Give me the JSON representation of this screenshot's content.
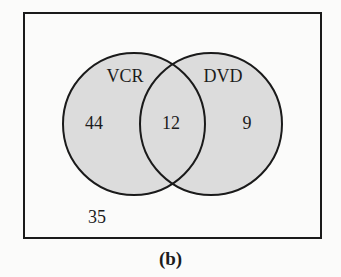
{
  "diagram": {
    "type": "venn",
    "universe_count": "35",
    "sets": [
      {
        "name": "VCR",
        "only_count": "44"
      },
      {
        "name": "DVD",
        "only_count": "9"
      }
    ],
    "intersection_count": "12",
    "caption": "(b)",
    "colors": {
      "fill": "#dcdcdc",
      "stroke": "#1a1a1a"
    }
  }
}
